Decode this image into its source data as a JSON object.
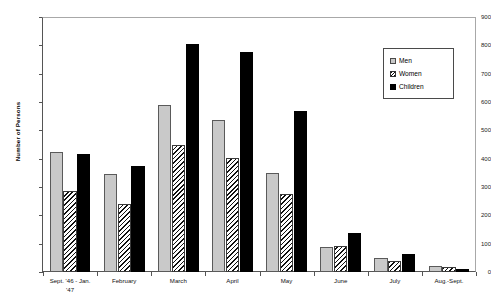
{
  "chart_data": {
    "type": "bar",
    "title": "",
    "xlabel": "",
    "ylabel": "Number of Persons",
    "ylim": [
      0,
      900
    ],
    "ytick_step": 100,
    "yticks": [
      0,
      100,
      200,
      300,
      400,
      500,
      600,
      700,
      800,
      900
    ],
    "grid": false,
    "legend_position": "top-right",
    "categories": [
      "Sept. '46 - Jan. '47",
      "February",
      "March",
      "April",
      "May",
      "June",
      "July",
      "Aug.-Sept."
    ],
    "category_lines": [
      [
        "Sept. '46 - Jan.",
        "'47"
      ],
      [
        "February"
      ],
      [
        "March"
      ],
      [
        "April"
      ],
      [
        "May"
      ],
      [
        "June"
      ],
      [
        "July"
      ],
      [
        "Aug.-Sept."
      ]
    ],
    "series": [
      {
        "name": "Men",
        "fill": "#c9c9c9",
        "pattern": "solid-light-gray",
        "values": [
          425,
          345,
          588,
          535,
          350,
          88,
          48,
          22
        ]
      },
      {
        "name": "Women",
        "fill": "#ffffff",
        "pattern": "diagonal-hatch",
        "values": [
          285,
          240,
          450,
          403,
          275,
          92,
          38,
          18
        ]
      },
      {
        "name": "Children",
        "fill": "#000000",
        "pattern": "solid-black",
        "values": [
          415,
          375,
          803,
          775,
          568,
          137,
          65,
          10
        ]
      }
    ]
  },
  "legend": {
    "items": [
      {
        "label": "Men",
        "swatch": "men"
      },
      {
        "label": "Women",
        "swatch": "women"
      },
      {
        "label": "Children",
        "swatch": "children"
      }
    ]
  },
  "axis": {
    "y_title": "Number of Persons"
  }
}
